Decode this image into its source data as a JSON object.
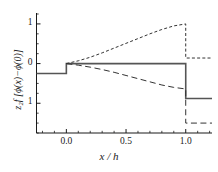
{
  "figure": {
    "background": "#ffffff",
    "foreground": "#1a1a1a"
  },
  "axis": {
    "ylabel": "z₂f [ϕ(x)−ϕ(0)]",
    "xlabel": "x / h",
    "xticks": [
      "0.0",
      "0.5",
      "1.0"
    ],
    "yticks": [
      "1",
      "0",
      "1"
    ]
  },
  "chart_data": {
    "type": "line",
    "title": "",
    "xlabel": "x / h",
    "ylabel": "z2f [phi(x) - phi(0)]",
    "xlim": [
      -0.25,
      1.22
    ],
    "ylim": [
      -1.75,
      1.25
    ],
    "xticks": [
      0.0,
      0.5,
      1.0
    ],
    "xtick_labels": [
      "0.0",
      "0.5",
      "1.0"
    ],
    "yticks": [
      1.0,
      0.0,
      -1.0
    ],
    "ytick_labels": [
      "1",
      "0",
      "1"
    ],
    "grid": false,
    "legend": "none",
    "series": [
      {
        "name": "solid",
        "style": "solid",
        "color": "#555555",
        "linewidth": 1.6,
        "points": [
          [
            -0.25,
            -0.25
          ],
          [
            0.0,
            -0.25
          ],
          [
            0.0,
            0.0
          ],
          [
            0.5,
            0.0
          ],
          [
            1.0,
            0.0
          ],
          [
            1.0,
            -0.88
          ],
          [
            1.22,
            -0.88
          ]
        ]
      },
      {
        "name": "short-dashed",
        "style": "dashed-short",
        "color": "#333333",
        "linewidth": 1.0,
        "points": [
          [
            0.0,
            0.0
          ],
          [
            0.1,
            0.07
          ],
          [
            0.2,
            0.16
          ],
          [
            0.3,
            0.27
          ],
          [
            0.4,
            0.39
          ],
          [
            0.5,
            0.51
          ],
          [
            0.6,
            0.63
          ],
          [
            0.7,
            0.75
          ],
          [
            0.8,
            0.86
          ],
          [
            0.9,
            0.95
          ],
          [
            1.0,
            1.0
          ],
          [
            1.0,
            0.14
          ],
          [
            1.22,
            0.14
          ]
        ]
      },
      {
        "name": "long-dashed",
        "style": "dashed-long",
        "color": "#333333",
        "linewidth": 1.0,
        "points": [
          [
            0.0,
            0.0
          ],
          [
            0.1,
            -0.04
          ],
          [
            0.2,
            -0.09
          ],
          [
            0.3,
            -0.15
          ],
          [
            0.4,
            -0.22
          ],
          [
            0.5,
            -0.3
          ],
          [
            0.6,
            -0.38
          ],
          [
            0.7,
            -0.46
          ],
          [
            0.8,
            -0.54
          ],
          [
            0.9,
            -0.6
          ],
          [
            1.0,
            -0.64
          ],
          [
            1.0,
            -1.5
          ],
          [
            1.22,
            -1.5
          ]
        ]
      }
    ]
  }
}
